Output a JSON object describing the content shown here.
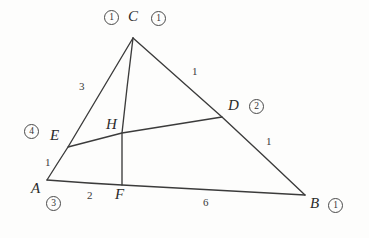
{
  "figure": {
    "stroke_color": "#3b3b3b",
    "label_color": "#2b2b2b",
    "background_color": "#fdfdfc"
  },
  "vertices": [
    {
      "name": "C",
      "label": "C",
      "x": 133,
      "y": 38
    },
    {
      "name": "A",
      "label": "A",
      "x": 47,
      "y": 180
    },
    {
      "name": "B",
      "label": "B",
      "x": 305,
      "y": 195
    },
    {
      "name": "D",
      "label": "D",
      "x": 222,
      "y": 117
    },
    {
      "name": "E",
      "label": "E",
      "x": 68,
      "y": 147
    },
    {
      "name": "F",
      "label": "F",
      "x": 122,
      "y": 185
    },
    {
      "name": "H",
      "label": "H",
      "x": 122,
      "y": 133
    }
  ],
  "vertex_labels": [
    {
      "name": "label-C",
      "text": "C",
      "left": 128,
      "top": 9
    },
    {
      "name": "label-D",
      "text": "D",
      "left": 228,
      "top": 98
    },
    {
      "name": "label-E",
      "text": "E",
      "left": 50,
      "top": 128
    },
    {
      "name": "label-H",
      "text": "H",
      "left": 106,
      "top": 117
    },
    {
      "name": "label-A",
      "text": "A",
      "left": 31,
      "top": 181
    },
    {
      "name": "label-F",
      "text": "F",
      "left": 115,
      "top": 187
    },
    {
      "name": "label-B",
      "text": "B",
      "left": 310,
      "top": 196
    }
  ],
  "segment_lengths": [
    {
      "name": "length-CE",
      "segment": "CE",
      "value": "3",
      "left": 79,
      "top": 81
    },
    {
      "name": "length-CD",
      "segment": "CD",
      "value": "1",
      "left": 192,
      "top": 66
    },
    {
      "name": "length-DB",
      "segment": "DB",
      "value": "1",
      "left": 266,
      "top": 136
    },
    {
      "name": "length-AE",
      "segment": "AE",
      "value": "1",
      "left": 45,
      "top": 157
    },
    {
      "name": "length-AF",
      "segment": "AF",
      "value": "2",
      "left": 87,
      "top": 190
    },
    {
      "name": "length-FB",
      "segment": "FB",
      "value": "6",
      "left": 203,
      "top": 197
    }
  ],
  "circled_numbers": [
    {
      "name": "circled-1-left-of-C",
      "value": "1",
      "left": 104,
      "top": 10
    },
    {
      "name": "circled-1-right-of-C",
      "value": "1",
      "left": 151,
      "top": 11
    },
    {
      "name": "circled-2-at-D",
      "value": "2",
      "left": 249,
      "top": 99
    },
    {
      "name": "circled-4-at-E",
      "value": "4",
      "left": 24,
      "top": 124
    },
    {
      "name": "circled-3-at-A",
      "value": "3",
      "left": 46,
      "top": 196
    },
    {
      "name": "circled-1-at-B",
      "value": "1",
      "left": 328,
      "top": 198
    }
  ],
  "edges": [
    {
      "name": "edge-AC",
      "from": "A",
      "to": "C"
    },
    {
      "name": "edge-CB",
      "from": "C",
      "to": "B"
    },
    {
      "name": "edge-AB",
      "from": "A",
      "to": "B"
    },
    {
      "name": "cevian-CF",
      "from": "C",
      "to": "F"
    },
    {
      "name": "cevian-ED",
      "from": "E",
      "to": "D"
    }
  ]
}
